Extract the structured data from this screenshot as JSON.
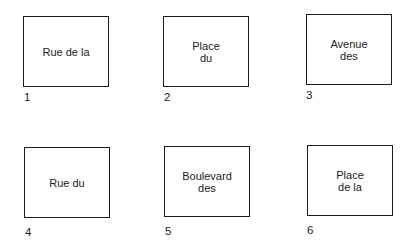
{
  "cards": [
    {
      "number": "1",
      "label": "Rue de la"
    },
    {
      "number": "2",
      "label": "Place\ndu"
    },
    {
      "number": "3",
      "label": "Avenue\ndes"
    },
    {
      "number": "4",
      "label": "Rue du"
    },
    {
      "number": "5",
      "label": "Boulevard\ndes"
    },
    {
      "number": "6",
      "label": "Place\nde la"
    }
  ]
}
